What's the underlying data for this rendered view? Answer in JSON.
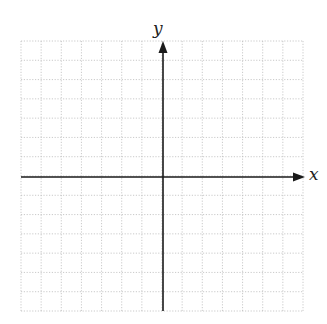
{
  "diagram": {
    "type": "coordinate-plane",
    "axes": {
      "x_label": "x",
      "y_label": "y"
    },
    "grid": {
      "columns": 14,
      "rows": 14,
      "columns_left_of_y_axis": 7,
      "rows_above_x_axis": 7,
      "line_style": "dotted",
      "line_color": "#bdbdbd"
    },
    "axis_color": "#1a1a1a",
    "arrows": [
      "x-positive",
      "y-positive"
    ]
  }
}
